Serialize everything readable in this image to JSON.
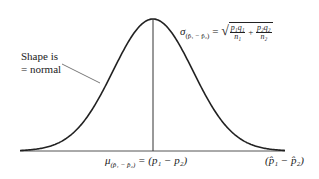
{
  "diagram": {
    "type": "normal-distribution-curve",
    "shape_label_line1": "Shape is",
    "shape_label_line2": "= normal",
    "sigma_symbol": "σ",
    "sigma_subscript": "(p̂₁ − p̂₂)",
    "equals": "=",
    "sqrt_symbol": "√",
    "frac1_num": "p₁q₁",
    "frac1_den": "n₁",
    "plus": "+",
    "frac2_num": "p₂q₂",
    "frac2_den": "n₂",
    "mu_symbol": "μ",
    "mu_subscript": "(p̂₁ − p̂₂)",
    "mu_value": "= (p₁ − p₂)",
    "axis_label": "(p̂₁ − p̂₂)",
    "line_color": "#222222"
  }
}
